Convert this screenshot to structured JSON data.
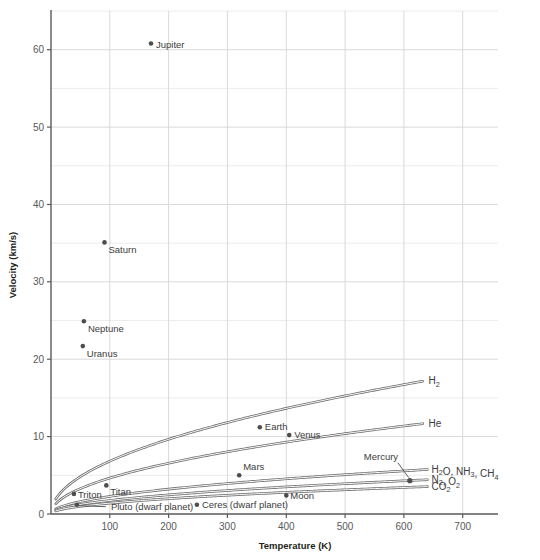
{
  "chart_data": {
    "type": "scatter",
    "title": "",
    "xlabel": "Temperature (K)",
    "ylabel": "Velocity (km/s)",
    "xlim": [
      0,
      760
    ],
    "ylim": [
      0,
      65
    ],
    "xticks": [
      100,
      200,
      300,
      400,
      500,
      600,
      700
    ],
    "yticks": [
      0,
      10,
      20,
      30,
      40,
      50,
      60
    ],
    "minor_yticks": [
      5,
      15,
      25,
      35,
      45,
      55,
      65
    ],
    "grid": true,
    "legend_position": "inline-right",
    "points": [
      {
        "label": "Jupiter",
        "x": 170,
        "y": 60.8,
        "label_dx": 5,
        "label_dy": 4
      },
      {
        "label": "Saturn",
        "x": 91,
        "y": 35.1,
        "label_dx": 4,
        "label_dy": 11
      },
      {
        "label": "Neptune",
        "x": 56,
        "y": 24.9,
        "label_dx": 4,
        "label_dy": 11
      },
      {
        "label": "Uranus",
        "x": 54,
        "y": 21.7,
        "label_dx": 4,
        "label_dy": 11
      },
      {
        "label": "Earth",
        "x": 355,
        "y": 11.2,
        "label_dx": 5,
        "label_dy": 3
      },
      {
        "label": "Venus",
        "x": 405,
        "y": 10.2,
        "label_dx": 5,
        "label_dy": 3
      },
      {
        "label": "Mars",
        "x": 320,
        "y": 5.0,
        "label_dx": 4,
        "label_dy": -5
      },
      {
        "label": "Moon",
        "x": 400,
        "y": 2.4,
        "label_dx": 4,
        "label_dy": 4
      },
      {
        "label": "Titan",
        "x": 94,
        "y": 3.7,
        "label_dx": 4,
        "label_dy": 10
      },
      {
        "label": "Triton",
        "x": 39,
        "y": 2.6,
        "label_dx": 4,
        "label_dy": 4
      },
      {
        "label": "Ceres (dwarf planet)",
        "x": 248,
        "y": 1.2,
        "label_dx": 5,
        "label_dy": 3
      },
      {
        "label": "Pluto (dwarf planet)",
        "x": 44,
        "y": 1.2,
        "label_dx": 0,
        "label_dy": 0,
        "leader": true
      }
    ],
    "mercury": {
      "label": "Mercury",
      "x": 610,
      "y": 4.3
    },
    "series": [
      {
        "name": "H2",
        "label": "H₂",
        "k": 0.681,
        "x_end": 635,
        "y_end": 17.2
      },
      {
        "name": "He",
        "label": "He",
        "k": 0.464,
        "x_end": 635,
        "y_end": 11.7
      },
      {
        "name": "H2O_NH3_CH4",
        "label": "H₂O, NH₃, CH₄",
        "k": 0.227,
        "x_end": 640,
        "y_end": 5.75
      },
      {
        "name": "N2_O2",
        "label": "N₂, O₂",
        "k": 0.175,
        "x_end": 640,
        "y_end": 4.43
      },
      {
        "name": "CO2",
        "label": "CO₂",
        "k": 0.14,
        "x_end": 640,
        "y_end": 3.54
      }
    ]
  },
  "axes": {
    "x_title": "Temperature (K)",
    "y_title": "Velocity (km/s)",
    "x_tick_labels": [
      "100",
      "200",
      "300",
      "400",
      "500",
      "600",
      "700"
    ],
    "y_tick_labels": [
      "0",
      "10",
      "20",
      "30",
      "40",
      "50",
      "60"
    ]
  },
  "colors": {
    "point": "#4d4d4d",
    "curve": "#6f6f6f",
    "grid_major": "#d9d9d9",
    "grid_minor": "#ececec",
    "axis": "#58595b",
    "text": "#231f20"
  }
}
